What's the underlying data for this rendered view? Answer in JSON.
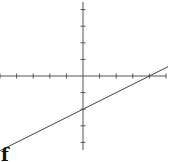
{
  "chart_data": {
    "type": "line",
    "title": "",
    "xlabel": "",
    "ylabel": "",
    "panel_label": "f",
    "grid": false,
    "axes": {
      "x_ticks": [
        -5,
        -4,
        -3,
        -2,
        -1,
        1,
        2,
        3,
        4,
        5
      ],
      "y_ticks": [
        -4,
        -3,
        -2,
        -1,
        1,
        2,
        3,
        4
      ],
      "tick_labels_shown": false
    },
    "xlim": [
      -5,
      5
    ],
    "ylim": [
      -4.5,
      4.5
    ],
    "series": [
      {
        "name": "line",
        "equation": "y = 0.5x - 2",
        "x": [
          -5,
          5
        ],
        "y": [
          -4.5,
          0.5
        ],
        "x_intercept": 4,
        "y_intercept": -2
      }
    ]
  },
  "style": {
    "axis_color": "#555555",
    "line_color": "#444444"
  }
}
